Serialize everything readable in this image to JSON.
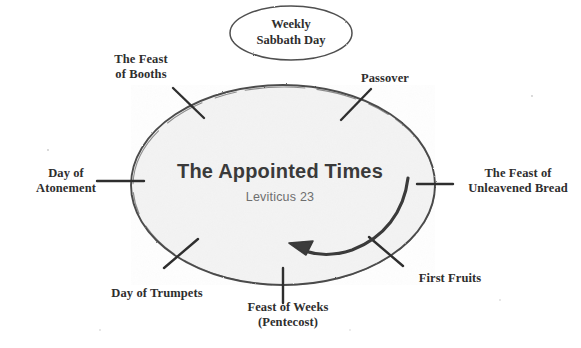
{
  "diagram": {
    "title": "The Appointed Times",
    "subtitle": "Leviticus 23",
    "sabbath_oval": "Weekly\nSabbath Day",
    "colors": {
      "background": "#ffffff",
      "circle_fill": "#f4f4f4",
      "stroke": "#3a3a3a",
      "title_text": "#3a3a3a",
      "subtitle_text": "#6e6e6e",
      "label_text": "#2e2e2e"
    },
    "feasts": [
      {
        "id": "booths",
        "label": "The Feast\nof Booths",
        "position": "top-left"
      },
      {
        "id": "passover",
        "label": "Passover",
        "position": "top-right"
      },
      {
        "id": "unleavened",
        "label": "The Feast of\nUnleavened Bread",
        "position": "right"
      },
      {
        "id": "first-fruits",
        "label": "First Fruits",
        "position": "bottom-right"
      },
      {
        "id": "weeks",
        "label": "Feast of Weeks\n(Pentecost)",
        "position": "bottom-center"
      },
      {
        "id": "trumpets",
        "label": "Day of Trumpets",
        "position": "bottom-left"
      },
      {
        "id": "atonement",
        "label": "Day of\nAtonement",
        "position": "left"
      }
    ],
    "arrow": {
      "name": "counterclockwise-cycle-arrow",
      "direction": "counterclockwise"
    }
  }
}
